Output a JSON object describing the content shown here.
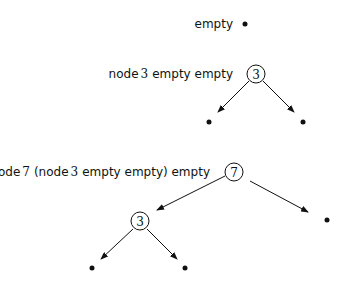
{
  "diagrams": [
    {
      "expression": "empty",
      "parts": [
        "empty"
      ],
      "tree": "empty leaf"
    },
    {
      "expression": "node 3 empty empty",
      "parts": [
        "node",
        "3",
        "empty empty"
      ],
      "root_value": "3"
    },
    {
      "expression": "node 7 (node 3 empty empty) empty",
      "parts": [
        "node",
        "7",
        "(node",
        "3",
        "empty empty) empty"
      ],
      "root_value": "7",
      "child_value": "3"
    }
  ]
}
